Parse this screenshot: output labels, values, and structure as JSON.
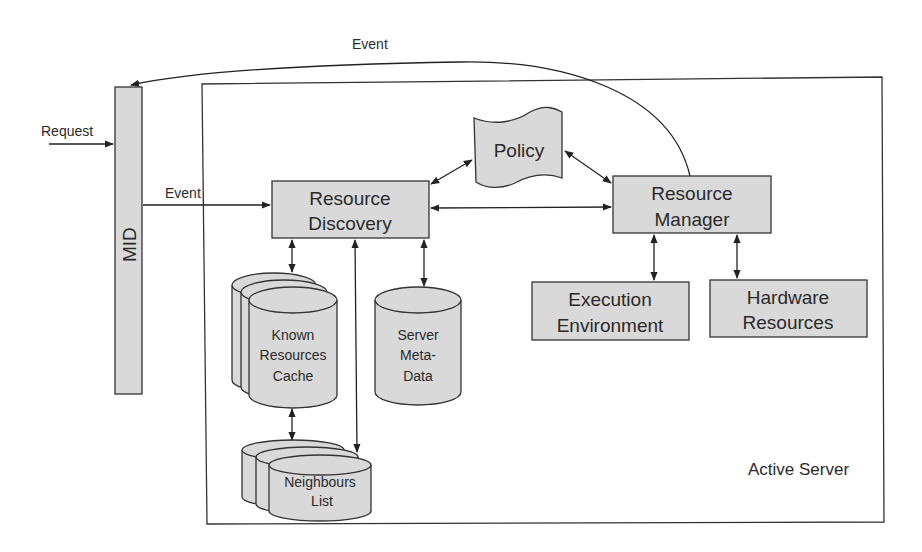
{
  "diagram": {
    "container": {
      "label": "Active Server"
    },
    "mid": {
      "label": "MID"
    },
    "request": {
      "label": "Request"
    },
    "events": {
      "top": "Event",
      "mid_to_discovery": "Event"
    },
    "nodes": {
      "resource_discovery": {
        "line1": "Resource",
        "line2": "Discovery"
      },
      "policy": {
        "label": "Policy"
      },
      "resource_manager": {
        "line1": "Resource",
        "line2": "Manager"
      },
      "execution_environment": {
        "line1": "Execution",
        "line2": "Environment"
      },
      "hardware_resources": {
        "line1": "Hardware",
        "line2": "Resources"
      },
      "known_resources_cache": {
        "line1": "Known",
        "line2": "Resources",
        "line3": "Cache"
      },
      "server_meta_data": {
        "line1": "Server",
        "line2": "Meta-",
        "line3": "Data"
      },
      "neighbours_list": {
        "line1": "Neighbours",
        "line2": "List"
      }
    },
    "colors": {
      "fill": "#d9d9d9",
      "stroke": "#333333",
      "background": "#ffffff"
    }
  }
}
